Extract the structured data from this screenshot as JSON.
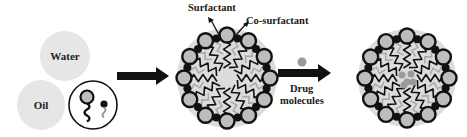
{
  "diagram": {
    "phases": {
      "water_label": "Water",
      "oil_label": "Oil"
    },
    "legend_icon": "surfactant-and-cosurfactant-molecules-icon",
    "labels": {
      "surfactant": "Surfactant",
      "co_surfactant": "Co-surfactant",
      "drug_line1": "Drug",
      "drug_line2": "molecules"
    },
    "steps": [
      {
        "id": "components",
        "description": "Water, oil, surfactant and co-surfactant"
      },
      {
        "id": "empty-microemulsion",
        "description": "Micelle formed by surfactant and co-surfactant"
      },
      {
        "id": "drug-loaded-microemulsion",
        "description": "Micelle with drug molecules in core"
      }
    ],
    "colors": {
      "phase_fill": "#e6e6e6",
      "micelle_background": "#dcdcdc",
      "head_fill": "#bdbdbd",
      "outline": "#111111",
      "drug": "#9a9a9a",
      "tail_secondary": "#a8a8a8"
    }
  }
}
